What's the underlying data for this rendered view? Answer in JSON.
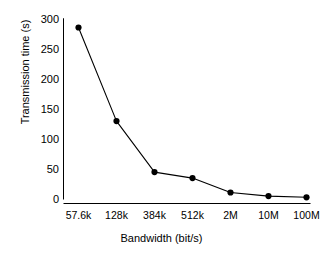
{
  "chart_data": {
    "type": "line",
    "title": "",
    "xlabel": "Bandwidth (bit/s)",
    "ylabel": "Transmission time (s)",
    "categories": [
      "57.6k",
      "128k",
      "384k",
      "512k",
      "2M",
      "10M",
      "100M"
    ],
    "values": [
      285,
      129,
      44,
      34,
      10,
      4,
      2
    ],
    "series": [
      {
        "name": "Transmission time",
        "values": [
          285,
          129,
          44,
          34,
          10,
          4,
          2
        ],
        "color": "#000000",
        "marker": "circle",
        "line_style": "solid"
      }
    ],
    "yticks": [
      0,
      50,
      100,
      150,
      200,
      250,
      300
    ],
    "ylim": [
      0,
      300
    ],
    "grid": false,
    "legend": false,
    "legend_position": "none",
    "axis_color": "#000000",
    "background_color": "#ffffff"
  },
  "axes": {
    "y_tick_labels": [
      "300",
      "250",
      "200",
      "150",
      "100",
      "50",
      "0"
    ],
    "x_tick_labels": [
      "57.6k",
      "128k",
      "384k",
      "512k",
      "2M",
      "10M",
      "100M"
    ],
    "y_title": "Transmission time (s)",
    "x_title": "Bandwidth (bit/s)"
  }
}
